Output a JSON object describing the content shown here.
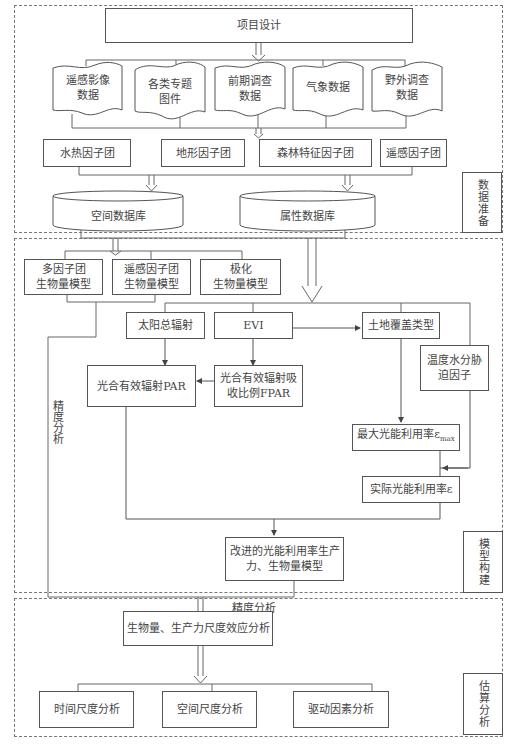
{
  "sections": [
    {
      "id": "data-prep",
      "label": "数据准备"
    },
    {
      "id": "model-build",
      "label": "模型构建"
    },
    {
      "id": "estimate-analysis",
      "label": "估算分析"
    }
  ],
  "data_prep": {
    "project_design": "项目设计",
    "data_sources": [
      {
        "line1": "遥感影像",
        "line2": "数据"
      },
      {
        "line1": "各类专题",
        "line2": "图件"
      },
      {
        "line1": "前期调查",
        "line2": "数据"
      },
      {
        "line1": "气象数据",
        "line2": ""
      },
      {
        "line1": "野外调查",
        "line2": "数据"
      }
    ],
    "factor_groups": [
      "水热因子团",
      "地形因子团",
      "森林特征因子团",
      "遥感因子团"
    ],
    "databases": [
      "空间数据库",
      "属性数据库"
    ]
  },
  "model_build": {
    "models": [
      {
        "line1": "多因子团",
        "line2": "生物量模型"
      },
      {
        "line1": "遥感因子团",
        "line2": "生物量模型"
      },
      {
        "line1": "极化",
        "line2": "生物量模型"
      }
    ],
    "solar_radiation": "太阳总辐射",
    "evi": "EVI",
    "land_cover": "土地覆盖类型",
    "stress_factor": {
      "line1": "温度水分胁",
      "line2": "迫因子"
    },
    "par": "光合有效辐射PAR",
    "fpar": {
      "line1": "光合有效辐射吸",
      "line2": "收比例FPAR"
    },
    "max_lue": {
      "text": "最大光能利用率ε",
      "sub": "max"
    },
    "actual_lue": "实际光能利用率ε",
    "improved_model": {
      "line1": "改进的光能利用率生产",
      "line2": "力、生物量模型"
    },
    "accuracy_vertical": "精度分析",
    "accuracy_bottom": "精度分析"
  },
  "estimate": {
    "scale_effect": "生物量、生产力尺度效应分析",
    "analyses": [
      "时间尺度分析",
      "空间尺度分析",
      "驱动因素分析"
    ]
  }
}
